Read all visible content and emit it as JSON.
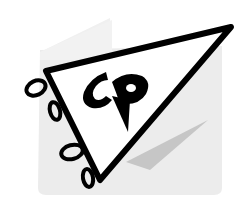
{
  "logo": {
    "letters": "CP",
    "description": "Pennant flag logo with stylized CP monogram",
    "colors": {
      "outline": "#000000",
      "pennant_fill": "#ffffff",
      "backdrop": "#ececec",
      "backdrop_light": "#f2f2f2",
      "shadow": "#c8c8c8"
    },
    "icons": [
      "pennant-icon",
      "bow-icon",
      "bow-icon"
    ]
  }
}
